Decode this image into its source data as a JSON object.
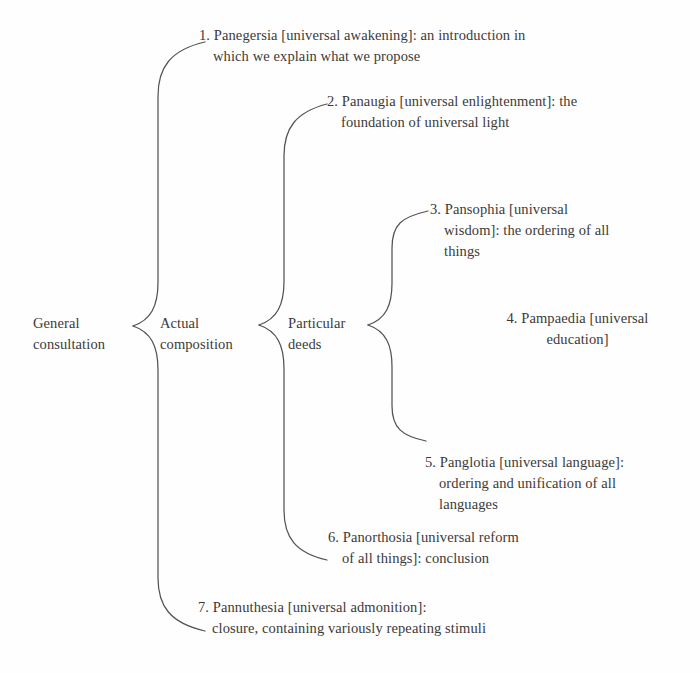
{
  "diagram": {
    "type": "bracket-tree",
    "title_text_visible": false,
    "ink_color": "#3b3a38",
    "background_color": "#fefefe",
    "root": {
      "id": "general-consultation",
      "lines": [
        "General",
        "consultation"
      ]
    },
    "level2": {
      "id": "actual-composition",
      "lines": [
        "Actual",
        "composition"
      ]
    },
    "level3": {
      "id": "particular-deeds",
      "lines": [
        "Particular",
        "deeds"
      ]
    },
    "items": [
      {
        "number": "1.",
        "name": "Panegersia",
        "gloss": "[universal awakening]",
        "lines": [
          "1. Panegersia [universal awakening]: an introduction in",
          "which we explain what we propose"
        ]
      },
      {
        "number": "2.",
        "name": "Panaugia",
        "gloss": "[universal enlightenment]",
        "lines": [
          "2. Panaugia [universal enlightenment]: the",
          "foundation of universal light"
        ]
      },
      {
        "number": "3.",
        "name": "Pansophia",
        "gloss": "[universal wisdom]",
        "lines": [
          "3. Pansophia [universal",
          "wisdom]: the ordering of all",
          "things"
        ]
      },
      {
        "number": "4.",
        "name": "Pampaedia",
        "gloss": "[universal education]",
        "lines": [
          "4. Pampaedia [universal",
          "education]"
        ]
      },
      {
        "number": "5.",
        "name": "Panglotia",
        "gloss": "[universal language]",
        "lines": [
          "5. Panglotia [universal language]:",
          "ordering and unification of all",
          "languages"
        ]
      },
      {
        "number": "6.",
        "name": "Panorthosia",
        "gloss": "[universal reform of all things]",
        "lines": [
          "6. Panorthosia [universal reform",
          "of all things]: conclusion"
        ]
      },
      {
        "number": "7.",
        "name": "Pannuthesia",
        "gloss": "[universal admonition]",
        "lines": [
          "7. Pannuthesia [universal admonition]:",
          "closure, containing variously repeating stimuli"
        ]
      }
    ],
    "braces": [
      {
        "id": "brace-1",
        "notch_x": 133,
        "notch_y": 326,
        "top_y": 42,
        "bottom_y": 631,
        "arm_x": 160
      },
      {
        "id": "brace-2",
        "notch_x": 259,
        "notch_y": 325,
        "top_y": 104,
        "bottom_y": 560,
        "arm_x": 286
      },
      {
        "id": "brace-3",
        "notch_x": 368,
        "notch_y": 325,
        "top_y": 211,
        "bottom_y": 441,
        "arm_x": 395
      }
    ]
  }
}
